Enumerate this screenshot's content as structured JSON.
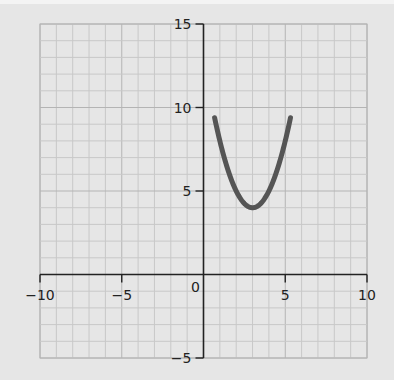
{
  "chart_data": {
    "type": "line",
    "title": "",
    "xlabel": "",
    "ylabel": "",
    "function": "y = (x - 3)^2 + 4",
    "xlim": [
      -10,
      10
    ],
    "ylim": [
      -5,
      15
    ],
    "grid": true,
    "grid_minor_step": 1,
    "grid_major_step": 5,
    "x_ticks": [
      -10,
      -5,
      0,
      5,
      10
    ],
    "x_tick_labels": [
      "−10",
      "−5",
      "0",
      "5",
      "10"
    ],
    "y_ticks": [
      -5,
      5,
      10,
      15
    ],
    "y_tick_labels": [
      "−5",
      "5",
      "10",
      "15"
    ],
    "vertex": {
      "x": 3,
      "y": 4
    },
    "series": [
      {
        "name": "parabola",
        "color": "#555555",
        "x": [
          0.68,
          1,
          1.5,
          2,
          2.5,
          3,
          3.5,
          4,
          4.5,
          5,
          5.32
        ],
        "y": [
          15,
          8,
          6.25,
          5,
          4.25,
          4,
          4.25,
          5,
          6.25,
          8,
          15
        ]
      }
    ]
  },
  "colors": {
    "background": "#e6e6e6",
    "grid_minor": "#c8c8c8",
    "grid_major": "#b4b4b4",
    "axis": "#222222",
    "curve": "#555555"
  }
}
